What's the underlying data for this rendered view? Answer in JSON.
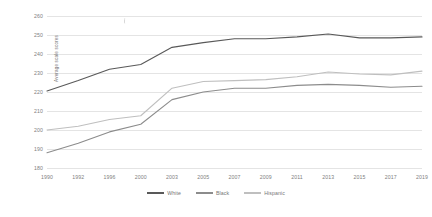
{
  "chart_data": {
    "type": "line",
    "title": "",
    "xlabel": "",
    "ylabel": "Average scale scores",
    "categories": [
      "1990",
      "1992",
      "1996",
      "2000",
      "2003",
      "2005",
      "2007",
      "2009",
      "2011",
      "2013",
      "2015",
      "2017",
      "2019"
    ],
    "ylim": [
      180,
      260
    ],
    "yticks": [
      "180",
      "190",
      "200",
      "210",
      "220",
      "230",
      "240",
      "250",
      "260"
    ],
    "grid": true,
    "legend_position": "bottom-center",
    "series": [
      {
        "name": "White",
        "color": "#595959",
        "values": [
          220.5,
          226.0,
          232.0,
          234.5,
          243.5,
          246.0,
          248.0,
          248.0,
          249.0,
          250.5,
          248.5,
          248.5,
          249.0
        ]
      },
      {
        "name": "Black",
        "color": "#8c8c8c",
        "values": [
          188.0,
          193.0,
          199.0,
          203.0,
          216.0,
          220.0,
          222.0,
          222.0,
          223.5,
          224.0,
          223.5,
          222.5,
          223.0
        ]
      },
      {
        "name": "Hispanic",
        "color": "#bfbfbf",
        "values": [
          200.0,
          202.0,
          205.5,
          207.5,
          222.0,
          225.5,
          226.0,
          226.5,
          228.0,
          230.5,
          229.5,
          229.0,
          231.0
        ]
      }
    ]
  },
  "legend": {
    "items": [
      {
        "label": "White"
      },
      {
        "label": "Black"
      },
      {
        "label": "Hispanic"
      }
    ]
  },
  "colors": {
    "gridline": "#e4e4e4",
    "tick_text": "#808080",
    "axis_title_text": "#6a6a6a",
    "background": "#ffffff"
  }
}
